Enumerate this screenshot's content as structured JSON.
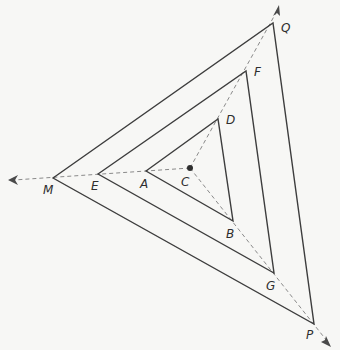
{
  "diagram": {
    "center": {
      "label": "C",
      "x": 190,
      "y": 168
    },
    "triangles": [
      {
        "name": "inner",
        "vertices": [
          "A",
          "D",
          "B"
        ]
      },
      {
        "name": "middle",
        "vertices": [
          "E",
          "F",
          "G"
        ]
      },
      {
        "name": "outer",
        "vertices": [
          "M",
          "Q",
          "P"
        ]
      }
    ],
    "points": {
      "A": {
        "label": "A",
        "x": 146,
        "y": 171,
        "lx": 140,
        "ly": 188
      },
      "B": {
        "label": "B",
        "x": 233,
        "y": 221,
        "lx": 226,
        "ly": 238
      },
      "C": {
        "label": "C",
        "x": 190,
        "y": 168,
        "lx": 181,
        "ly": 186
      },
      "D": {
        "label": "D",
        "x": 218,
        "y": 119,
        "lx": 226,
        "ly": 124
      },
      "E": {
        "label": "E",
        "x": 98,
        "y": 174,
        "lx": 91,
        "ly": 190
      },
      "F": {
        "label": "F",
        "x": 246,
        "y": 71,
        "lx": 254,
        "ly": 76
      },
      "G": {
        "label": "G",
        "x": 274,
        "y": 273,
        "lx": 266,
        "ly": 290
      },
      "M": {
        "label": "M",
        "x": 53,
        "y": 178,
        "lx": 43,
        "ly": 194
      },
      "P": {
        "label": "P",
        "x": 314,
        "y": 324,
        "lx": 306,
        "ly": 339
      },
      "Q": {
        "label": "Q",
        "x": 273,
        "y": 23,
        "lx": 281,
        "ly": 32
      }
    },
    "rays": [
      {
        "from": "C",
        "through": [
          "A",
          "E",
          "M"
        ],
        "arrow_end": {
          "x": 8,
          "y": 180
        }
      },
      {
        "from": "C",
        "through": [
          "D",
          "F",
          "Q"
        ],
        "arrow_end": {
          "x": 279,
          "y": 5
        }
      },
      {
        "from": "C",
        "through": [
          "B",
          "G",
          "P"
        ],
        "arrow_end": {
          "x": 331,
          "y": 346
        }
      }
    ],
    "colors": {
      "background": "#f7f7f5",
      "triangle_stroke": "#3d3d3d",
      "ray_stroke": "#8a8a8a",
      "label": "#2e2e2e"
    }
  }
}
